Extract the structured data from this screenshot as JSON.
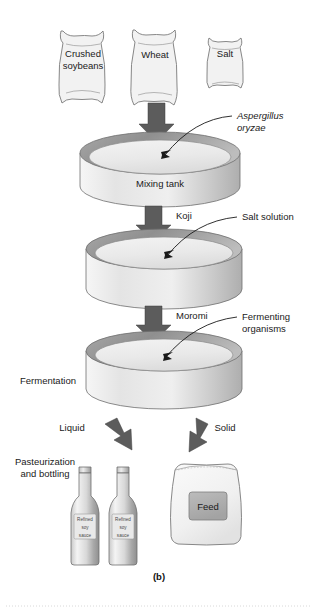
{
  "figure": {
    "caption": "(b)",
    "ingredients": [
      {
        "name": "bag-crushed-soybeans",
        "line1": "Crushed",
        "line2": "soybeans"
      },
      {
        "name": "bag-wheat",
        "line1": "Wheat",
        "line2": ""
      },
      {
        "name": "bag-salt",
        "line1": "Salt",
        "line2": ""
      }
    ],
    "tanks": [
      {
        "name": "mixing-tank",
        "label": "Mixing tank"
      },
      {
        "name": "koji-tank",
        "label": ""
      },
      {
        "name": "fermentation-tank",
        "label": ""
      }
    ],
    "stage_labels": {
      "fermentation": "Fermentation"
    },
    "flow_labels": [
      {
        "name": "flow-label-koji",
        "text": "Koji"
      },
      {
        "name": "flow-label-moromi",
        "text": "Moromi"
      },
      {
        "name": "flow-label-liquid",
        "text": "Liquid"
      },
      {
        "name": "flow-label-solid",
        "text": "Solid"
      }
    ],
    "callouts": [
      {
        "name": "callout-aspergillus",
        "line1": "Aspergillus",
        "line2": "oryzae",
        "italic": true
      },
      {
        "name": "callout-salt-solution",
        "line1": "Salt solution",
        "line2": "",
        "italic": false
      },
      {
        "name": "callout-fermenting-organisms",
        "line1": "Fermenting",
        "line2": "organisms",
        "italic": false
      }
    ],
    "outputs": {
      "pasteurization": {
        "line1": "Pasteurization",
        "line2": "and bottling"
      },
      "bottle_label": {
        "line1": "Refined",
        "line2": "soy",
        "line3": "sauce"
      },
      "feed_bag_label": "Feed"
    },
    "colors": {
      "background": "#ffffff",
      "arrow": "#5c5c5c",
      "outline": "#6f6f6f",
      "tank_rim_dark": "#8c8c8c",
      "tank_body_light": "#ededed",
      "text": "#1a1a1a"
    }
  }
}
